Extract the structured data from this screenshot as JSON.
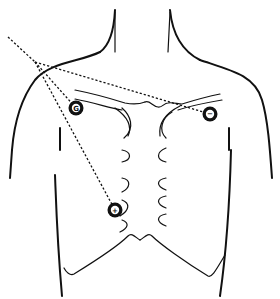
{
  "diagram": {
    "type": "ecg-electrode-placement",
    "electrodes": [
      {
        "id": "ground",
        "label": "G",
        "x": 76,
        "y": 108,
        "position": "right infraclavicular (viewer left)"
      },
      {
        "id": "negative",
        "label": "−",
        "x": 210,
        "y": 114,
        "position": "left infraclavicular (viewer right)"
      },
      {
        "id": "positive",
        "label": "+",
        "x": 115,
        "y": 210,
        "position": "lower right chest near rib margin"
      }
    ],
    "lead_lines": {
      "style": "dashed",
      "convergence_point": {
        "x": 35,
        "y": 62
      },
      "extension_end": {
        "x": 8,
        "y": 37
      },
      "connects": [
        "ground",
        "negative",
        "positive"
      ]
    },
    "colors": {
      "line": "#111111",
      "background": "#ffffff"
    }
  }
}
